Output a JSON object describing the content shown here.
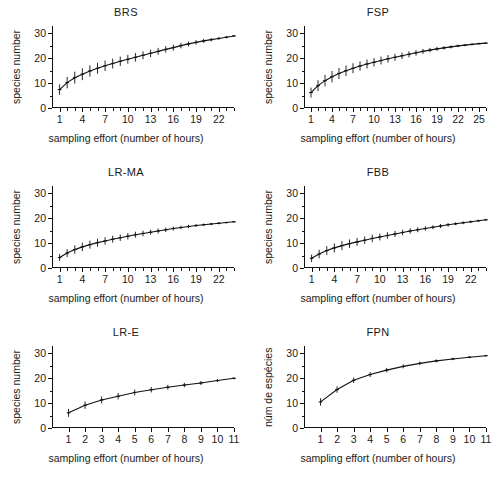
{
  "figure": {
    "axis_title_x": "sampling effort (number of hours)",
    "axis_title_y_en": "species number",
    "axis_title_y_pt": "núm de espécies",
    "line_color": "#111111",
    "error_bar_color": "#111111",
    "ylim": [
      0,
      33
    ],
    "yticks_major": [
      0,
      10,
      20,
      30
    ],
    "yticks_minor": [
      5,
      15,
      25
    ],
    "grid": false,
    "legend": null
  },
  "chart_data": [
    {
      "type": "line",
      "title": "BRS",
      "panel": "top-left",
      "xlabel": "sampling effort (number of hours)",
      "ylabel": "species number",
      "xlim": [
        0,
        24
      ],
      "ylim": [
        0,
        33
      ],
      "xticks_labeled": [
        1,
        4,
        7,
        10,
        13,
        16,
        19,
        22
      ],
      "x": [
        1,
        2,
        3,
        4,
        5,
        6,
        7,
        8,
        9,
        10,
        11,
        12,
        13,
        14,
        15,
        16,
        17,
        18,
        19,
        20,
        21,
        22,
        23,
        24
      ],
      "values": [
        7.4,
        10.2,
        12.2,
        13.6,
        14.9,
        16.0,
        17.0,
        17.9,
        18.8,
        19.6,
        20.4,
        21.2,
        22.0,
        22.8,
        23.6,
        24.3,
        25.1,
        25.8,
        26.4,
        27.0,
        27.5,
        28.0,
        28.5,
        29.0
      ],
      "error": [
        2.1,
        2.3,
        2.4,
        2.4,
        2.3,
        2.2,
        2.1,
        2.0,
        1.9,
        1.8,
        1.7,
        1.6,
        1.5,
        1.4,
        1.3,
        1.2,
        1.1,
        1.0,
        0.9,
        0.8,
        0.7,
        0.6,
        0.5,
        0.4
      ]
    },
    {
      "type": "line",
      "title": "FSP",
      "panel": "top-right",
      "xlabel": "sampling effort (number of hours)",
      "ylabel": "species number",
      "xlim": [
        0,
        26
      ],
      "ylim": [
        0,
        33
      ],
      "xticks_labeled": [
        1,
        4,
        7,
        10,
        13,
        16,
        19,
        22,
        25
      ],
      "x": [
        1,
        2,
        3,
        4,
        5,
        6,
        7,
        8,
        9,
        10,
        11,
        12,
        13,
        14,
        15,
        16,
        17,
        18,
        19,
        20,
        21,
        22,
        23,
        24,
        25,
        26
      ],
      "values": [
        6.2,
        9.0,
        11.0,
        12.6,
        13.9,
        15.0,
        16.0,
        16.9,
        17.7,
        18.4,
        19.1,
        19.8,
        20.4,
        21.0,
        21.6,
        22.2,
        22.8,
        23.3,
        23.8,
        24.2,
        24.6,
        25.0,
        25.3,
        25.6,
        25.9,
        26.1
      ],
      "error": [
        2.0,
        2.2,
        2.3,
        2.3,
        2.2,
        2.1,
        2.0,
        1.9,
        1.8,
        1.7,
        1.6,
        1.5,
        1.4,
        1.3,
        1.2,
        1.1,
        1.0,
        0.9,
        0.8,
        0.7,
        0.6,
        0.5,
        0.45,
        0.4,
        0.35,
        0.3
      ]
    },
    {
      "type": "line",
      "title": "LR-MA",
      "panel": "middle-left",
      "xlabel": "sampling effort (number of hours)",
      "ylabel": "species number",
      "xlim": [
        0,
        24
      ],
      "ylim": [
        0,
        33
      ],
      "xticks_labeled": [
        1,
        4,
        7,
        10,
        13,
        16,
        19,
        22
      ],
      "x": [
        1,
        2,
        3,
        4,
        5,
        6,
        7,
        8,
        9,
        10,
        11,
        12,
        13,
        14,
        15,
        16,
        17,
        18,
        19,
        20,
        21,
        22,
        23,
        24
      ],
      "values": [
        4.2,
        6.0,
        7.4,
        8.5,
        9.4,
        10.2,
        10.9,
        11.6,
        12.2,
        12.8,
        13.4,
        13.9,
        14.4,
        14.9,
        15.4,
        15.9,
        16.3,
        16.7,
        17.1,
        17.4,
        17.7,
        18.0,
        18.3,
        18.6
      ],
      "error": [
        1.4,
        1.6,
        1.7,
        1.7,
        1.6,
        1.6,
        1.5,
        1.4,
        1.3,
        1.3,
        1.2,
        1.1,
        1.0,
        1.0,
        0.9,
        0.8,
        0.7,
        0.7,
        0.6,
        0.5,
        0.45,
        0.4,
        0.35,
        0.3
      ]
    },
    {
      "type": "line",
      "title": "FBB",
      "panel": "middle-right",
      "xlabel": "sampling effort (number of hours)",
      "ylabel": "species number",
      "xlim": [
        0,
        24
      ],
      "ylim": [
        0,
        33
      ],
      "xticks_labeled": [
        1,
        4,
        7,
        10,
        13,
        16,
        19,
        22
      ],
      "x": [
        1,
        2,
        3,
        4,
        5,
        6,
        7,
        8,
        9,
        10,
        11,
        12,
        13,
        14,
        15,
        16,
        17,
        18,
        19,
        20,
        21,
        22,
        23,
        24
      ],
      "values": [
        3.9,
        5.6,
        7.0,
        8.1,
        9.0,
        9.8,
        10.5,
        11.2,
        11.9,
        12.5,
        13.1,
        13.7,
        14.3,
        14.9,
        15.4,
        15.9,
        16.4,
        16.9,
        17.4,
        17.8,
        18.2,
        18.6,
        19.0,
        19.4
      ],
      "error": [
        1.5,
        1.7,
        1.8,
        1.8,
        1.8,
        1.7,
        1.6,
        1.5,
        1.5,
        1.4,
        1.3,
        1.2,
        1.1,
        1.1,
        1.0,
        0.9,
        0.8,
        0.8,
        0.7,
        0.6,
        0.55,
        0.5,
        0.45,
        0.4
      ]
    },
    {
      "type": "line",
      "title": "LR-E",
      "panel": "bottom-left",
      "xlabel": "sampling effort (number of hours)",
      "ylabel": "species number",
      "xlim": [
        0,
        11
      ],
      "ylim": [
        0,
        33
      ],
      "xticks_labeled": [
        1,
        2,
        3,
        4,
        5,
        6,
        7,
        8,
        9,
        10,
        11
      ],
      "x": [
        1,
        2,
        3,
        4,
        5,
        6,
        7,
        8,
        9,
        10,
        11
      ],
      "values": [
        6.1,
        9.2,
        11.3,
        12.8,
        14.3,
        15.4,
        16.4,
        17.3,
        18.1,
        19.1,
        20.0
      ],
      "error": [
        1.6,
        1.5,
        1.4,
        1.3,
        1.2,
        1.1,
        1.0,
        0.9,
        0.8,
        0.6,
        0.4
      ]
    },
    {
      "type": "line",
      "title": "FPN",
      "panel": "bottom-right",
      "xlabel": "sampling effort (number of hours)",
      "ylabel": "núm de espécies",
      "xlim": [
        0,
        11
      ],
      "ylim": [
        0,
        33
      ],
      "xticks_labeled": [
        1,
        2,
        3,
        4,
        5,
        6,
        7,
        8,
        9,
        10,
        11
      ],
      "x": [
        1,
        2,
        3,
        4,
        5,
        6,
        7,
        8,
        9,
        10,
        11
      ],
      "values": [
        10.5,
        15.5,
        19.2,
        21.5,
        23.3,
        24.8,
        26.0,
        27.0,
        27.8,
        28.5,
        29.1
      ],
      "error": [
        1.5,
        1.3,
        1.1,
        1.0,
        0.9,
        0.8,
        0.7,
        0.6,
        0.5,
        0.4,
        0.3
      ]
    }
  ]
}
